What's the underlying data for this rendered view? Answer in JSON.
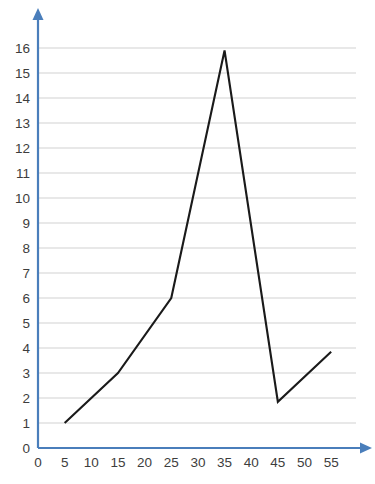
{
  "chart_data": {
    "type": "line",
    "title": "",
    "subtitle": "",
    "xlabel": "",
    "ylabel": "",
    "xlim": [
      0,
      58
    ],
    "ylim": [
      0,
      16.6
    ],
    "grid": "horizontal",
    "legend": "none",
    "x_ticks": [
      0,
      5,
      10,
      15,
      20,
      25,
      30,
      35,
      40,
      45,
      50,
      55
    ],
    "y_ticks": [
      0,
      1,
      2,
      3,
      4,
      5,
      6,
      7,
      8,
      9,
      10,
      11,
      12,
      13,
      14,
      15,
      16
    ],
    "series": [
      {
        "name": "series-1",
        "color": "#1a1a1a",
        "x": [
          5,
          15,
          25,
          35,
          45,
          55
        ],
        "y": [
          1,
          3,
          6,
          15.9,
          1.85,
          3.85
        ],
        "points": [
          {
            "x": 5,
            "y": 1
          },
          {
            "x": 15,
            "y": 3
          },
          {
            "x": 25,
            "y": 6
          },
          {
            "x": 35,
            "y": 15.9
          },
          {
            "x": 45,
            "y": 1.85
          },
          {
            "x": 55,
            "y": 3.85
          }
        ]
      }
    ],
    "colors": {
      "axis": "#4a7ebb",
      "grid": "#e8e8e8",
      "line": "#1a1a1a",
      "tick_text": "#3d3d3d",
      "background": "#ffffff"
    }
  },
  "axes": {
    "y_origin_label": "0",
    "x_origin_label": "0"
  }
}
